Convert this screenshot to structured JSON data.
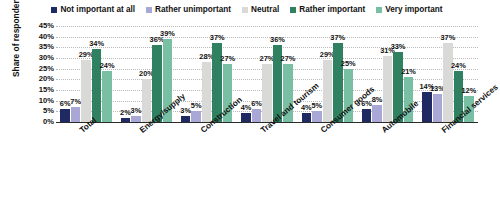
{
  "chart_data": {
    "type": "bar",
    "title": "",
    "subtitle": "",
    "xlabel": "",
    "ylabel": "Share of respondents",
    "ylim": [
      0,
      45
    ],
    "ytick_labels": [
      "45%",
      "40%",
      "35%",
      "30%",
      "25%",
      "20%",
      "15%",
      "10%",
      "5%",
      "0%"
    ],
    "ytick_values": [
      45,
      40,
      35,
      30,
      25,
      20,
      15,
      10,
      5,
      0
    ],
    "grid": true,
    "legend_position": "top-center",
    "categories": [
      "Total",
      "Energy/supply",
      "Construction",
      "Travel and tourism",
      "Consumer goods",
      "Automobile",
      "Financial services"
    ],
    "series": [
      {
        "name": "Not important at all",
        "color": "#1f2a63",
        "values": [
          6,
          2,
          3,
          4,
          4,
          6,
          14
        ],
        "labels": [
          "6%",
          "2%",
          "3%",
          "4%",
          "4%",
          "6%",
          "14%"
        ]
      },
      {
        "name": "Rather unimportant",
        "color": "#a9a7d6",
        "values": [
          7,
          3,
          5,
          6,
          5,
          8,
          13
        ],
        "labels": [
          "7%",
          "3%",
          "5%",
          "6%",
          "5%",
          "8%",
          "13%"
        ]
      },
      {
        "name": "Neutral",
        "color": "#d9dad8",
        "values": [
          29,
          20,
          28,
          27,
          29,
          31,
          37
        ],
        "labels": [
          "29%",
          "20%",
          "28%",
          "27%",
          "29%",
          "31%",
          "37%"
        ]
      },
      {
        "name": "Rather important",
        "color": "#2f8161",
        "values": [
          34,
          36,
          37,
          36,
          37,
          33,
          24
        ],
        "labels": [
          "34%",
          "36%",
          "37%",
          "36%",
          "37%",
          "33%",
          "24%"
        ]
      },
      {
        "name": "Very important",
        "color": "#78bfa3",
        "values": [
          24,
          39,
          27,
          27,
          25,
          21,
          12
        ],
        "labels": [
          "24%",
          "39%",
          "27%",
          "27%",
          "25%",
          "21%",
          "12%"
        ]
      }
    ]
  }
}
